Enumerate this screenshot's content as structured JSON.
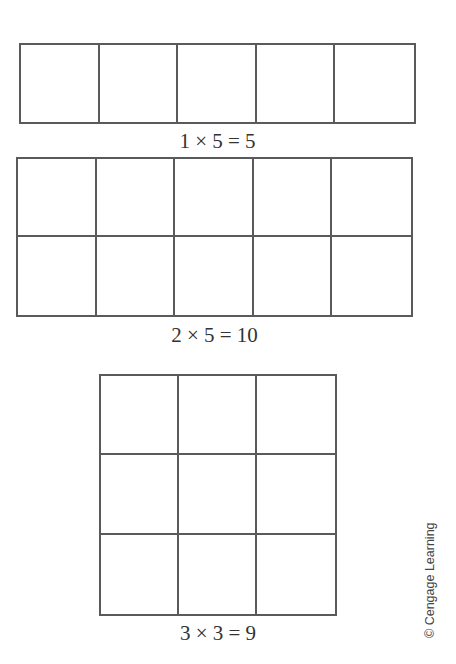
{
  "figures": [
    {
      "rows": 1,
      "cols": 5,
      "equation": "1 × 5 = 5",
      "box": {
        "left": 19,
        "top": 43,
        "width": 397,
        "height": 81
      },
      "label_pos": {
        "left": 19,
        "top": 131,
        "width": 397
      }
    },
    {
      "rows": 2,
      "cols": 5,
      "equation": "2 × 5 = 10",
      "box": {
        "left": 16,
        "top": 157,
        "width": 397,
        "height": 160
      },
      "label_pos": {
        "left": 16,
        "top": 325,
        "width": 397
      }
    },
    {
      "rows": 3,
      "cols": 3,
      "equation": "3 × 3 = 9",
      "box": {
        "left": 99,
        "top": 374,
        "width": 238,
        "height": 242
      },
      "label_pos": {
        "left": 99,
        "top": 623,
        "width": 238
      }
    }
  ],
  "credit": "© Cengage Learning",
  "colors": {
    "line": "#5a5a5a",
    "text": "#333333",
    "background": "#ffffff"
  }
}
